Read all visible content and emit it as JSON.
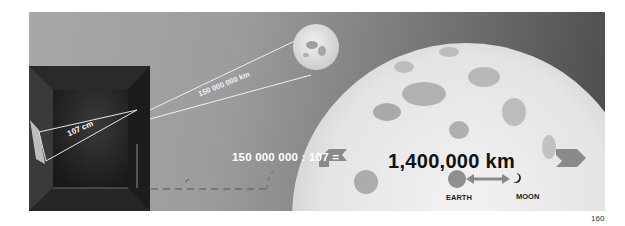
{
  "figure": {
    "page_number": "160",
    "box_label": "107 cm",
    "distance_label": "150 000 000 km",
    "ratio_expression": "150 000 000 : 107 =",
    "sun_diameter_label": "1,400,000 km",
    "earth_label": "EARTH",
    "moon_label": "MOON"
  },
  "colors": {
    "background_gray": "#9c9c9c",
    "box_dark": "#111111",
    "sun_light": "#e9e9e9",
    "sun_spots": "#9a9a9a",
    "arrow_gray": "#8a8a8a",
    "text_white": "#ffffff",
    "text_dark": "#111111"
  }
}
